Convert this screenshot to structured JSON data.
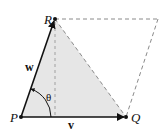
{
  "diagram": {
    "type": "vector-parallelogram",
    "points": {
      "P": {
        "label": "P",
        "x": 21,
        "y": 117
      },
      "Q": {
        "label": "Q",
        "x": 126,
        "y": 117
      },
      "R": {
        "label": "R",
        "x": 55,
        "y": 19
      },
      "S": {
        "x": 158,
        "y": 19
      }
    },
    "vectors": {
      "v": {
        "label": "v",
        "from": "P",
        "to": "Q"
      },
      "w": {
        "label": "w",
        "from": "P",
        "to": "R"
      }
    },
    "angle": {
      "label": "θ",
      "between": [
        "v",
        "w"
      ]
    },
    "colors": {
      "fill": "#e6e6e6",
      "stroke": "#111111",
      "dashed": "#8a8a8a"
    }
  }
}
